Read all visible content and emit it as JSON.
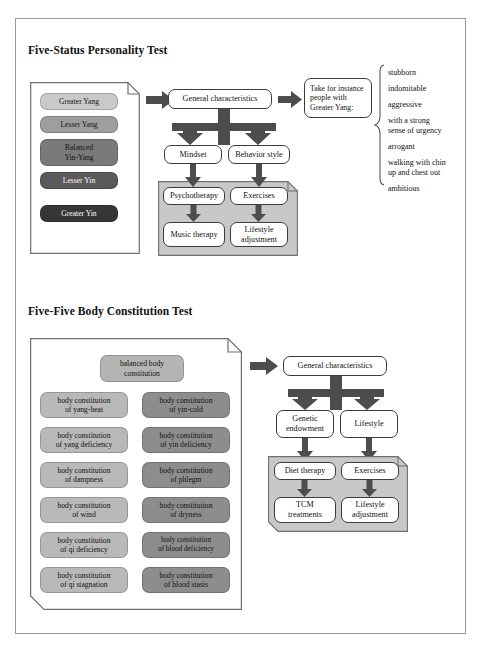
{
  "sections": [
    {
      "title": "Five-Status Personality Test",
      "statuses": [
        {
          "label": "Greater Yang",
          "color": "#c9c9c9",
          "text_color": "#111111"
        },
        {
          "label": "Lesser Yang",
          "color": "#9e9e9e",
          "text_color": "#111111"
        },
        {
          "label": "Balanced\nYin-Yang",
          "color": "#7a7a7a",
          "text_color": "#111111"
        },
        {
          "label": "Lesser Yin",
          "color": "#5a5a5a",
          "text_color": "#ffffff"
        },
        {
          "label": "Greater Yin",
          "color": "#363636",
          "text_color": "#ffffff"
        }
      ],
      "flow": {
        "root": "General characteristics",
        "branch_left": "Mindset",
        "branch_right": "Behavior style",
        "treatment_left_top": "Psychotherapy",
        "treatment_left_bottom": "Music therapy",
        "treatment_right_top": "Exercises",
        "treatment_right_bottom": "Lifestyle\nadjustment"
      },
      "example": {
        "prompt": "Take for instance\npeople with\nGreater Yang:",
        "traits": [
          "stubborn",
          "indomitable",
          "aggressive",
          "with a strong\nsense of urgency",
          "arrogant",
          "walking with chin\nup and chest out",
          "ambitious"
        ]
      }
    },
    {
      "title": "Five-Five Body Constitution Test",
      "balanced": {
        "label": "balanced body\nconstitution",
        "color": "#b4b4b4"
      },
      "constitutions_left": [
        {
          "label": "body constitution\nof yang-heat",
          "color": "#b9b9b9"
        },
        {
          "label": "body constitution\nof yang deficiency",
          "color": "#b9b9b9"
        },
        {
          "label": "body constitution\nof dampness",
          "color": "#b9b9b9"
        },
        {
          "label": "body constitution\nof wind",
          "color": "#b9b9b9"
        },
        {
          "label": "body constitution\nof qi deficiency",
          "color": "#b9b9b9"
        },
        {
          "label": "body constitution\nof qi stagnation",
          "color": "#b9b9b9"
        }
      ],
      "constitutions_right": [
        {
          "label": "body constitution\nof yin-cold",
          "color": "#8d8d8d"
        },
        {
          "label": "body constitution\nof yin deficiency",
          "color": "#8d8d8d"
        },
        {
          "label": "body constitution\nof phlegm",
          "color": "#8d8d8d"
        },
        {
          "label": "body constitution\nof dryness",
          "color": "#8d8d8d"
        },
        {
          "label": "body constitution\nof blood deficiency",
          "color": "#8d8d8d"
        },
        {
          "label": "body constitution\nof blood stasis",
          "color": "#8d8d8d"
        }
      ],
      "flow": {
        "root": "General characteristics",
        "branch_left": "Genetic\nendowment",
        "branch_right": "Lifestyle",
        "treatment_left_top": "Diet therapy",
        "treatment_left_bottom": "TCM\ntreatments",
        "treatment_right_top": "Exercises",
        "treatment_right_bottom": "Lifestyle\nadjustment"
      }
    }
  ],
  "colors": {
    "arrow": "#4d4d4d",
    "shaded_panel": "#c8c8c8",
    "frame_border": "#9a9a9a",
    "node_border": "#3c3c3c"
  }
}
